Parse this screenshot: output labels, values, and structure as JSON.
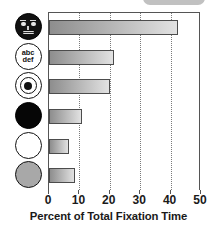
{
  "chart_data": {
    "type": "bar",
    "orientation": "horizontal",
    "title": "",
    "xlabel": "Percent of Total Fixation Time",
    "ylabel": "",
    "xlim": [
      0,
      50
    ],
    "xticks": [
      0,
      10,
      20,
      30,
      40,
      50
    ],
    "xtick_labels": [
      "0",
      "10",
      "20",
      "30",
      "40",
      "50"
    ],
    "grid": "vertical-dotted",
    "legend": "none",
    "categories": [
      "face-icon",
      "abc-def-text-icon",
      "bullseye-target-icon",
      "black-circle-icon",
      "white-circle-icon",
      "gray-circle-icon"
    ],
    "category_labels": [
      "",
      "abc def",
      "",
      "",
      "",
      ""
    ],
    "values": [
      42.5,
      21.5,
      20.0,
      11.0,
      6.5,
      8.5
    ],
    "bar_color": "#b0b0b0",
    "bar_edge_color": "#4c4c4c"
  },
  "icons": [
    {
      "name": "face-icon",
      "kind": "face",
      "fill": "#111111"
    },
    {
      "name": "abc-def-text-icon",
      "kind": "text",
      "line1": "abc",
      "line2": "def",
      "fill": "#ffffff"
    },
    {
      "name": "bullseye-target-icon",
      "kind": "target",
      "fill": "#ffffff"
    },
    {
      "name": "black-circle-icon",
      "kind": "solid",
      "fill": "#060606"
    },
    {
      "name": "white-circle-icon",
      "kind": "solid",
      "fill": "#ffffff"
    },
    {
      "name": "gray-circle-icon",
      "kind": "solid",
      "fill": "#a8a8a8"
    }
  ],
  "axis": {
    "xlabel": "Percent of Total Fixation Time",
    "ticks": [
      "0",
      "10",
      "20",
      "30",
      "40",
      "50"
    ]
  }
}
